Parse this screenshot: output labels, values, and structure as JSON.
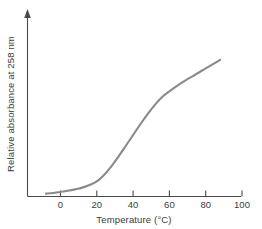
{
  "chart_data": {
    "type": "line",
    "title": "",
    "subtitle": "",
    "xlabel": "Temperature (°C)",
    "ylabel": "Relative absorbance at 258 nm",
    "xlim": [
      -12,
      100
    ],
    "ylim": [
      0,
      1.08
    ],
    "xticks": [
      0,
      20,
      40,
      60,
      80,
      100
    ],
    "xtick_labels": [
      "0",
      "20",
      "40",
      "60",
      "80",
      "100"
    ],
    "yticks": [],
    "ytick_labels": [],
    "grid": false,
    "legend": false,
    "legend_position": "none",
    "annotations": [],
    "axis_style": "y-axis has arrowhead at top; no y tick marks",
    "series": [
      {
        "name": "DNA melting curve",
        "color": "#8a8a8a",
        "line_width": 2.1,
        "x": [
          -8,
          -4,
          0,
          4,
          8,
          12,
          16,
          20,
          24,
          28,
          32,
          36,
          40,
          44,
          48,
          52,
          56,
          60,
          64,
          68,
          72,
          76,
          80,
          84,
          88
        ],
        "y": [
          0.02,
          0.025,
          0.032,
          0.04,
          0.05,
          0.062,
          0.08,
          0.105,
          0.15,
          0.21,
          0.28,
          0.355,
          0.43,
          0.505,
          0.575,
          0.64,
          0.695,
          0.735,
          0.772,
          0.805,
          0.835,
          0.865,
          0.895,
          0.925,
          0.955
        ]
      }
    ]
  },
  "labels": {
    "x_axis_title": "Temperature (°C)",
    "y_axis_title": "Relative absorbance at 258 nm",
    "xtick_0": "0",
    "xtick_1": "20",
    "xtick_2": "40",
    "xtick_3": "60",
    "xtick_4": "80",
    "xtick_5": "100"
  },
  "colors": {
    "curve": "#8a8a8a",
    "axis": "#4a4a4a",
    "text": "#3b3b3b",
    "background": "#ffffff"
  }
}
